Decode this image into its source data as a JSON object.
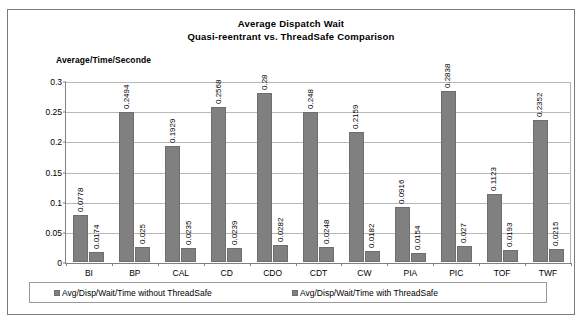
{
  "chart_data": {
    "type": "bar",
    "title": "Average Dispatch Wait",
    "subtitle": "Quasi-reentrant  vs. ThreadSafe Comparison",
    "ylabel": "Average/Time/Seconde",
    "xlabel": "",
    "ylim": [
      0,
      0.3
    ],
    "ytick_labels": [
      "0.3",
      "0.25",
      "0.2",
      "0.15",
      "0.1",
      "0.05",
      "0"
    ],
    "ytick_values": [
      0.3,
      0.25,
      0.2,
      0.15,
      0.1,
      0.05,
      0
    ],
    "grid": true,
    "legend_position": "bottom",
    "categories": [
      "BI",
      "BP",
      "CAL",
      "CD",
      "CDO",
      "CDT",
      "CW",
      "PIA",
      "PIC",
      "TOF",
      "TWF"
    ],
    "series": [
      {
        "name": "Avg/Disp/Wait/Time without ThreadSafe",
        "color": "#808080",
        "values": [
          0.0778,
          0.2494,
          0.1929,
          0.2568,
          0.28,
          0.248,
          0.2159,
          0.0916,
          0.2838,
          0.1123,
          0.2352
        ],
        "labels": [
          "0.0778",
          "0.2494",
          "0.1929",
          "0.2568",
          "0.28",
          "0.248",
          "0.2159",
          "0.0916",
          "0.2838",
          "0.1123",
          "0.2352"
        ]
      },
      {
        "name": "Avg/Disp/Wait/Time with ThreadSafe",
        "color": "#808080",
        "values": [
          0.0174,
          0.025,
          0.0235,
          0.0239,
          0.0282,
          0.0248,
          0.0182,
          0.0154,
          0.027,
          0.0193,
          0.0215
        ],
        "labels": [
          "0.0174",
          "0.025",
          "0.0235",
          "0.0239",
          "0.0282",
          "0.0248",
          "0.0182",
          "0.0154",
          "0.027",
          "0.0193",
          "0.0215"
        ]
      }
    ]
  },
  "legend": {
    "entries": [
      {
        "label": "Avg/Disp/Wait/Time without ThreadSafe"
      },
      {
        "label": "Avg/Disp/Wait/Time with  ThreadSafe"
      }
    ]
  }
}
